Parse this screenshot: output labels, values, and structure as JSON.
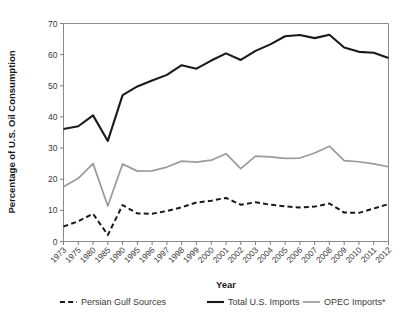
{
  "chart_data": {
    "type": "line",
    "title": "",
    "xlabel": "Year",
    "ylabel": "Percentage of U.S. Oil Consumption",
    "ylim": [
      0,
      70
    ],
    "yticks": [
      0,
      10,
      20,
      30,
      40,
      50,
      60,
      70
    ],
    "grid": false,
    "legend_position": "bottom",
    "categories": [
      "1973",
      "1975",
      "1980",
      "1985",
      "1990",
      "1995",
      "1996",
      "1997",
      "1998",
      "1999",
      "2000",
      "2001",
      "2002",
      "2003",
      "2004",
      "2005",
      "2006",
      "2007",
      "2008",
      "2009",
      "2010",
      "2011",
      "2012"
    ],
    "series": [
      {
        "name": "Persian Gulf Sources",
        "style": "dashed",
        "color": "#1a1a1a",
        "width": 2.0,
        "values": [
          4.8,
          6.5,
          8.9,
          2.1,
          11.7,
          9.0,
          8.9,
          9.8,
          11.0,
          12.5,
          13.1,
          14.0,
          11.8,
          12.6,
          11.8,
          11.3,
          10.9,
          11.2,
          12.2,
          9.3,
          9.2,
          10.6,
          12.0
        ]
      },
      {
        "name": "Total U.S. Imports",
        "style": "solid",
        "color": "#1a1a1a",
        "width": 2.1,
        "values": [
          36.1,
          37.0,
          40.5,
          32.3,
          47.0,
          49.8,
          51.7,
          53.5,
          56.6,
          55.5,
          58.1,
          60.4,
          58.3,
          61.2,
          63.3,
          65.9,
          66.3,
          65.3,
          66.4,
          62.3,
          60.9,
          60.6,
          58.9
        ]
      },
      {
        "name": "OPEC Imports*",
        "style": "solid",
        "color": "#9a9a9a",
        "width": 1.7,
        "values": [
          17.6,
          20.3,
          25.0,
          11.4,
          24.9,
          22.6,
          22.7,
          23.9,
          25.8,
          25.5,
          26.1,
          28.2,
          23.4,
          27.4,
          27.2,
          26.7,
          26.8,
          28.4,
          30.6,
          26.0,
          25.6,
          24.9,
          24.0
        ]
      }
    ]
  },
  "axes": {
    "ylabel": "Percentage of U.S. Oil Consumption",
    "xlabel": "Year"
  },
  "legend": {
    "items": [
      {
        "label": "Persian Gulf Sources"
      },
      {
        "label": "Total U.S. Imports"
      },
      {
        "label": "OPEC Imports*"
      }
    ]
  }
}
